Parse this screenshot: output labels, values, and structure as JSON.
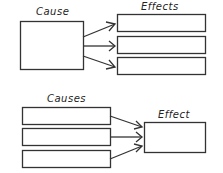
{
  "top_diagram": {
    "cause_label": "Cause",
    "effects_label": "Effects",
    "effect_boxes": [
      "",
      "",
      ""
    ]
  },
  "bottom_diagram": {
    "causes_label": "Causes",
    "effect_label": "Effect",
    "cause_boxes": [
      "",
      "",
      ""
    ]
  },
  "colors": {
    "stroke": "#333333",
    "background": "#ffffff"
  }
}
